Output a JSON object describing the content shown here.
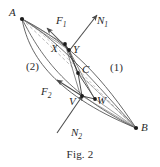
{
  "figure": {
    "caption": "Fig. 2",
    "colors": {
      "stroke": "#4a4a4a",
      "dashed": "#9a9a9a",
      "point": "#1c1c1c",
      "text": "#2b2b2b",
      "background": "#ffffff"
    },
    "points": [
      {
        "id": "A",
        "label": "A",
        "x": 22,
        "y": 19,
        "label_x": 9,
        "label_y": 7
      },
      {
        "id": "X",
        "label": "X",
        "x": 65,
        "y": 44,
        "label_x": 52,
        "label_y": 44
      },
      {
        "id": "Y",
        "label": "Y",
        "x": 69,
        "y": 50,
        "label_x": 74,
        "label_y": 45
      },
      {
        "id": "C",
        "label": "C",
        "x": 78,
        "y": 73,
        "label_x": 82,
        "label_y": 66
      },
      {
        "id": "V",
        "label": "V",
        "x": 82,
        "y": 96,
        "label_x": 70,
        "label_y": 98
      },
      {
        "id": "W",
        "label": "W",
        "x": 95,
        "y": 99,
        "label_x": 98,
        "label_y": 96
      },
      {
        "id": "B",
        "label": "B",
        "x": 136,
        "y": 128,
        "label_x": 142,
        "label_y": 124
      }
    ],
    "vectors": [
      {
        "id": "F1",
        "label": "F",
        "sub": "1",
        "from_x": 69,
        "from_y": 50,
        "to_x": 46,
        "to_y": 27,
        "label_x": 59,
        "label_y": 17
      },
      {
        "id": "N1",
        "label": "N",
        "sub": "1",
        "from_x": 69,
        "from_y": 50,
        "to_x": 98,
        "to_y": 14,
        "label_x": 98,
        "label_y": 17
      },
      {
        "id": "F2",
        "label": "F",
        "sub": "2",
        "from_x": 82,
        "from_y": 96,
        "to_x": 56,
        "to_y": 79,
        "label_x": 42,
        "label_y": 88
      },
      {
        "id": "N2",
        "label": "N",
        "sub": "2",
        "from_x": 58,
        "from_y": 132,
        "to_x": 84,
        "to_y": 94,
        "label_x": 74,
        "label_y": 128
      }
    ],
    "regions": [
      {
        "id": "region-1",
        "label": "(1)",
        "label_x": 112,
        "label_y": 67
      },
      {
        "id": "region-2",
        "label": "(2)",
        "label_x": 28,
        "label_y": 65
      }
    ],
    "curves": {
      "arc_outer_left": "M22,19 C30,48 50,90 136,128",
      "arc_outer_right": "M22,19 C70,45 100,80 136,128",
      "arc_inner_left": "M22,19 C34,44 56,88 136,128",
      "arc_inner_right": "M22,19 C62,42 96,84 136,128",
      "chord_dashed": "M22,19 L136,128",
      "dashed_inner": "M22,19 C48,38 86,82 136,128",
      "cell_XY_C": "M65,44 L78,73 L69,50 Z",
      "cell_C_VW": "M78,73 L82,96 L95,99 Z",
      "seg_X_V": "M65,44 L82,96",
      "seg_Y_W": "M69,50 L95,99",
      "seg_X_Y": "M65,44 L69,50",
      "seg_V_W": "M82,96 L95,99"
    }
  }
}
